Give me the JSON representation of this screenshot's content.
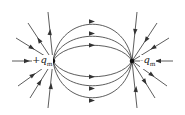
{
  "diagram": {
    "charges": [
      {
        "id": "positive",
        "label_sign": "+",
        "label_symbol": "q",
        "label_subscript": "m",
        "x": 53,
        "y": 61
      },
      {
        "id": "negative",
        "label_sign": "-",
        "label_symbol": "q",
        "label_subscript": "m",
        "x": 132,
        "y": 61
      }
    ],
    "line_color": "#333333",
    "arc_peaks_top": [
      20,
      33,
      45
    ],
    "arc_peaks_bottom": [
      76,
      89,
      101
    ]
  }
}
